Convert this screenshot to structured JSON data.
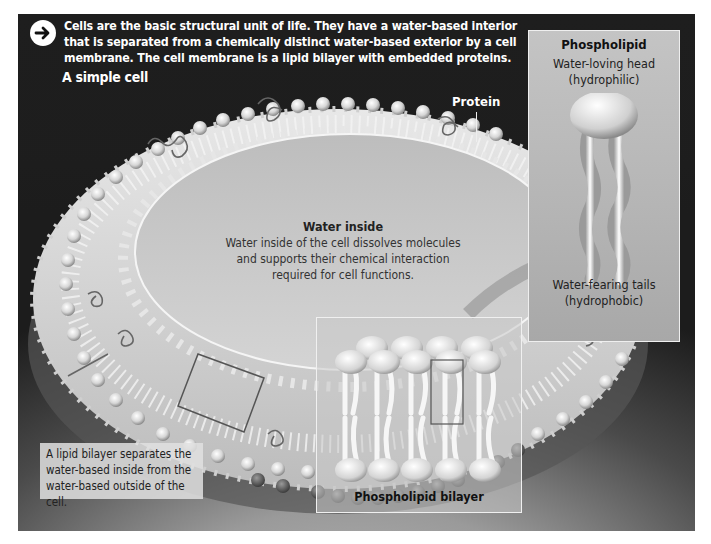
{
  "intro": {
    "icon": "arrow-right-circle-icon",
    "text": "Cells are the basic structural unit of life. They have a water-based interior that is separated from a chemically distinct water-based exterior by a cell membrane. The cell membrane is a lipid bilayer with embedded proteins."
  },
  "labels": {
    "simple_cell": "A simple cell",
    "protein": "Protein"
  },
  "water_inside": {
    "heading": "Water inside",
    "body": "Water inside of the cell dissolves molecules and supports their chemical interaction required for cell functions."
  },
  "phospholipid": {
    "heading": "Phospholipid",
    "head_label": "Water-loving head",
    "head_sub": "(hydrophilic)",
    "tail_label": "Water-fearing tails",
    "tail_sub": "(hydrophobic)"
  },
  "bilayer": {
    "caption": "Phospholipid bilayer"
  },
  "caption_box": {
    "text": "A lipid bilayer separates the water-based inside from the water-based outside of the cell."
  },
  "colors": {
    "background_dark": "#1c1c1c",
    "membrane": "#d8d8d8",
    "inner_water": "#c8c8c8",
    "panel_border": "#efefef"
  }
}
